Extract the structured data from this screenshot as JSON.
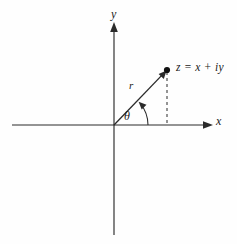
{
  "figure": {
    "background_color": "#fefefe",
    "ink_color": "#1a1a1a"
  },
  "axes": {
    "x_axis_label": "x",
    "y_axis_label": "y",
    "origin": {
      "x": 114,
      "y": 125
    },
    "x_axis": {
      "start_x": 12,
      "end_x": 213,
      "y": 125,
      "arrow": "right"
    },
    "y_axis": {
      "x": 114,
      "start_y": 235,
      "end_y": 22,
      "arrow": "up"
    }
  },
  "point": {
    "label": "z = x + iy",
    "marker": "filled-dot",
    "position": {
      "x": 167,
      "y": 70
    }
  },
  "vector": {
    "label": "r",
    "from": {
      "x": 114,
      "y": 125
    },
    "to": {
      "x": 167,
      "y": 70
    },
    "arrow": "to-point"
  },
  "angle": {
    "label": "θ",
    "arc_radius": 34,
    "from_degrees": 0,
    "to_degrees": 46,
    "arrow": "counterclockwise"
  },
  "projection": {
    "style": "dashed",
    "from": {
      "x": 167,
      "y": 70
    },
    "to": {
      "x": 167,
      "y": 125
    }
  }
}
